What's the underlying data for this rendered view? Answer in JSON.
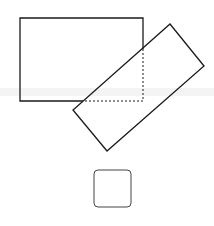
{
  "diagram": {
    "background": "#ffffff",
    "stroke_color": "#1a1a1a",
    "shapes": [
      {
        "id": "rectangle",
        "type": "rect",
        "x": 20,
        "y": 18,
        "width": 123,
        "height": 83
      },
      {
        "id": "rotated-rectangle",
        "type": "polygon",
        "points": "170,24 204,66 107,151 73,110"
      },
      {
        "id": "hidden-corner",
        "type": "dashed-polyline",
        "points": "143,49 143,101 83,101"
      },
      {
        "id": "rounded-square",
        "type": "rect",
        "x": 94,
        "y": 170,
        "width": 37,
        "height": 37,
        "radius": 4
      }
    ]
  }
}
